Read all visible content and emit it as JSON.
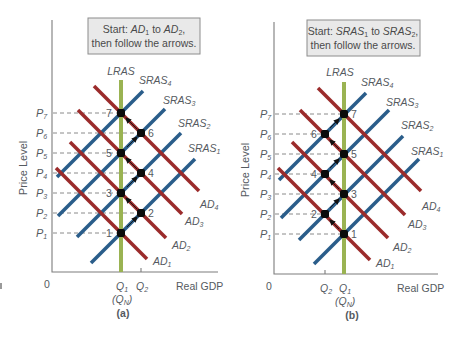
{
  "panels": [
    {
      "id": "a",
      "caption": "(a)",
      "instruction": {
        "line1_prefix": "Start: ",
        "line1_from": "AD",
        "line1_from_sub": "1",
        "line1_mid": " to ",
        "line1_to": "AD",
        "line1_to_sub": "2",
        "line1_suffix": ",",
        "line2": "then follow the arrows."
      },
      "y_axis_label": "Price Level",
      "x_axis_label": "Real GDP",
      "origin_label": "0",
      "lras_label": "LRAS",
      "x_ticks": [
        {
          "main": "Q",
          "sub": "1",
          "extra_main": "(Q",
          "extra_sub": "N",
          "extra_end": ")"
        },
        {
          "main": "Q",
          "sub": "2"
        }
      ],
      "price_levels": [
        "P1",
        "P2",
        "P3",
        "P4",
        "P5",
        "P6",
        "P7"
      ],
      "sras_labels": [
        "SRAS1",
        "SRAS2",
        "SRAS3",
        "SRAS4"
      ],
      "ad_labels": [
        "AD1",
        "AD2",
        "AD3",
        "AD4"
      ],
      "points": [
        "1",
        "2",
        "3",
        "4",
        "5",
        "6",
        "7"
      ]
    },
    {
      "id": "b",
      "caption": "(b)",
      "instruction": {
        "line1_prefix": "Start: ",
        "line1_from": "SRAS",
        "line1_from_sub": "1",
        "line1_mid": " to ",
        "line1_to": "SRAS",
        "line1_to_sub": "2",
        "line1_suffix": ",",
        "line2": "then follow the arrows."
      },
      "y_axis_label": "Price Level",
      "x_axis_label": "Real GDP",
      "origin_label": "0",
      "lras_label": "LRAS",
      "x_ticks": [
        {
          "main": "Q",
          "sub": "2"
        },
        {
          "main": "Q",
          "sub": "1",
          "extra_main": "(Q",
          "extra_sub": "N",
          "extra_end": ")"
        }
      ],
      "price_levels": [
        "P1",
        "P2",
        "P3",
        "P4",
        "P5",
        "P6",
        "P7"
      ],
      "sras_labels": [
        "SRAS1",
        "SRAS2",
        "SRAS3",
        "SRAS4"
      ],
      "ad_labels": [
        "AD1",
        "AD2",
        "AD3",
        "AD4"
      ],
      "points": [
        "1",
        "2",
        "3",
        "4",
        "5",
        "6",
        "7"
      ]
    }
  ],
  "colors": {
    "ad": "#9b2b2b",
    "sras": "#2a5d8a",
    "lras": "#9ab352",
    "box_fill": "#e9e9e9",
    "text": "#555a5f"
  }
}
